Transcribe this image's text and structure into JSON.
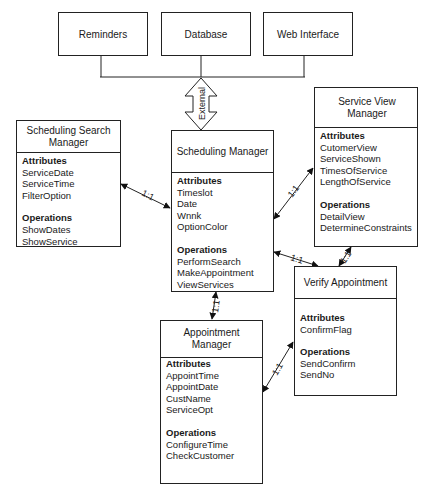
{
  "external_systems": [
    {
      "label": "Reminders"
    },
    {
      "label": "Database"
    },
    {
      "label": "Web Interface"
    }
  ],
  "external_arrow_label": "External",
  "classes": {
    "scheduling_search_manager": {
      "title": "Scheduling Search Manager",
      "attributes_title": "Attributes",
      "attributes": [
        "ServiceDate",
        "ServiceTime",
        "FilterOption"
      ],
      "operations_title": "Operations",
      "operations": [
        "ShowDates",
        "ShowService"
      ]
    },
    "scheduling_manager": {
      "title": "Scheduling Manager",
      "attributes_title": "Attributes",
      "attributes": [
        "Timeslot",
        "Date",
        "Wnnk",
        "OptionColor"
      ],
      "operations_title": "Operations",
      "operations": [
        "PerformSearch",
        "MakeAppointment",
        "ViewServices"
      ]
    },
    "service_view_manager": {
      "title": "Service View Manager",
      "attributes_title": "Attributes",
      "attributes": [
        "CutomerView",
        "ServiceShown",
        "TimesOfService",
        "LengthOfService"
      ],
      "operations_title": "Operations",
      "operations": [
        "DetailView",
        "DetermineConstraints"
      ]
    },
    "verify_appointment": {
      "title": "Verify Appointment",
      "attributes_title": "Attributes",
      "attributes": [
        "ConfirmFlag"
      ],
      "operations_title": "Operations",
      "operations": [
        "SendConfirm",
        "SendNo"
      ]
    },
    "appointment_manager": {
      "title": "Appointment Manager",
      "attributes_title": "Attributes",
      "attributes": [
        "AppointTime",
        "AppointDate",
        "CustName",
        "ServiceOpt"
      ],
      "operations_title": "Operations",
      "operations": [
        "ConfigureTime",
        "CheckCustomer"
      ]
    }
  },
  "relations": [
    {
      "from": "Scheduling Search Manager",
      "to": "Scheduling Manager",
      "label": "1:1"
    },
    {
      "from": "Scheduling Manager",
      "to": "Service View Manager",
      "label": "1:1"
    },
    {
      "from": "Scheduling Manager",
      "to": "Verify Appointment",
      "label": "1:1"
    },
    {
      "from": "Service View Manager",
      "to": "Verify Appointment",
      "label": "1:1"
    },
    {
      "from": "Scheduling Manager",
      "to": "Appointment Manager",
      "label": "1:1"
    },
    {
      "from": "Appointment Manager",
      "to": "Verify Appointment",
      "label": "1:1"
    }
  ]
}
